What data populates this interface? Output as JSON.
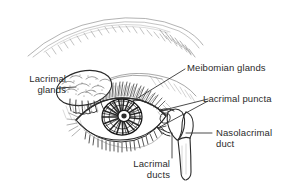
{
  "figure": {
    "name": "lacrimal-apparatus-diagram",
    "style": "pen-and-ink anatomical line drawing",
    "background_color": "#ffffff",
    "ink_color": "#2b2b2b",
    "width": 290,
    "height": 193
  },
  "labels": {
    "lacrimal_glands": {
      "line1": "Lacrimal",
      "line2": "glands"
    },
    "meibomian_glands": {
      "line1": "Meibomian glands"
    },
    "lacrimal_puncta": {
      "line1": "Lacrimal puncta"
    },
    "nasolacrimal_duct": {
      "line1": "Nasolacrimal",
      "line2": "duct"
    },
    "lacrimal_ducts": {
      "line1": "Lacrimal",
      "line2": "ducts"
    }
  },
  "structures": [
    {
      "name": "eyebrow",
      "description": "sketchy hatched arc above the eye"
    },
    {
      "name": "upper-eyelid",
      "description": "hatched lid with lashes"
    },
    {
      "name": "eyeball",
      "description": "almond-shaped palpebral fissure"
    },
    {
      "name": "iris",
      "description": "dark radially striated iris"
    },
    {
      "name": "pupil",
      "description": "central pupil"
    },
    {
      "name": "lower-eyelid-lashes",
      "description": "short vertical lashes"
    },
    {
      "name": "lacrimal-gland",
      "description": "stippled lobular gland, upper outer orbit"
    },
    {
      "name": "lacrimal-gland-ductules",
      "description": "finger-like excretory ductules"
    },
    {
      "name": "lacrimal-sac",
      "description": "sac at inner canthus"
    },
    {
      "name": "nasolacrimal-duct-tube",
      "description": "vertical duct descending to nose"
    },
    {
      "name": "lacrimal-canaliculus",
      "description": "small canal from puncta to sac"
    }
  ]
}
